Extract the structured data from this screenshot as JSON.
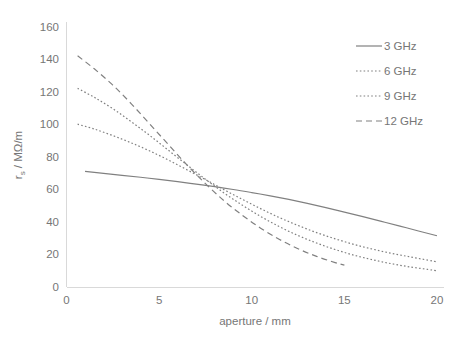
{
  "chart_data": {
    "type": "line",
    "title": "",
    "xlabel": "aperture / mm",
    "ylabel": "r_s / MΩ/m",
    "ylabel_base": "r",
    "ylabel_sub": "s",
    "ylabel_rest": " / MΩ/m",
    "xlim": [
      0,
      20
    ],
    "ylim": [
      0,
      160
    ],
    "xticks": [
      0,
      5,
      10,
      15,
      20
    ],
    "yticks": [
      0,
      20,
      40,
      60,
      80,
      100,
      120,
      140,
      160
    ],
    "xtick_labels": [
      "0",
      "5",
      "10",
      "15",
      "20"
    ],
    "ytick_labels": [
      "0",
      "20",
      "40",
      "60",
      "80",
      "100",
      "120",
      "140",
      "160"
    ],
    "grid": false,
    "legend_position": "top-right",
    "series": [
      {
        "name": "3 GHz",
        "style": "solid",
        "color": "#808080",
        "x": [
          1.0,
          2.0,
          3.0,
          4.0,
          5.0,
          6.0,
          7.0,
          8.0,
          9.0,
          10.0,
          11.0,
          12.0,
          13.0,
          14.0,
          15.0,
          16.0,
          17.0,
          18.0,
          19.0,
          20.0
        ],
        "y": [
          71.0,
          69.8,
          68.6,
          67.4,
          66.1,
          64.7,
          63.2,
          61.6,
          59.9,
          58.0,
          56.0,
          53.8,
          51.4,
          48.8,
          46.0,
          43.2,
          40.3,
          37.4,
          34.4,
          31.5
        ]
      },
      {
        "name": "6 GHz",
        "style": "dotted",
        "color": "#808080",
        "x": [
          0.6,
          1.5,
          2.5,
          3.5,
          4.5,
          5.5,
          6.5,
          7.5,
          8.5,
          9.5,
          10.5,
          11.5,
          12.5,
          13.5,
          14.5,
          15.5,
          16.5,
          17.5,
          18.5,
          19.5,
          20.0
        ],
        "y": [
          100.0,
          97.0,
          93.0,
          88.5,
          83.5,
          78.0,
          72.0,
          66.0,
          59.8,
          53.8,
          48.0,
          42.6,
          37.8,
          33.4,
          29.6,
          26.2,
          23.3,
          20.8,
          18.6,
          16.5,
          15.5
        ]
      },
      {
        "name": "9 GHz",
        "style": "dashdot",
        "color": "#808080",
        "x": [
          0.6,
          1.5,
          2.5,
          3.5,
          4.5,
          5.5,
          6.5,
          7.5,
          8.5,
          9.5,
          10.5,
          11.5,
          12.5,
          13.5,
          14.5,
          15.5,
          16.5,
          17.5,
          18.5,
          19.5,
          20.0
        ],
        "y": [
          122.0,
          116.5,
          109.5,
          101.5,
          93.0,
          84.0,
          75.0,
          66.2,
          57.8,
          50.2,
          43.2,
          37.0,
          31.6,
          27.0,
          23.0,
          19.6,
          16.8,
          14.4,
          12.4,
          10.8,
          10.0
        ]
      },
      {
        "name": "12 GHz",
        "style": "dashed",
        "color": "#808080",
        "x": [
          0.6,
          1.5,
          2.5,
          3.5,
          4.5,
          5.5,
          6.5,
          7.5,
          8.5,
          9.5,
          10.5,
          11.5,
          12.5,
          13.5,
          14.5,
          15.0
        ],
        "y": [
          142.0,
          134.0,
          124.0,
          112.5,
          100.0,
          87.5,
          75.0,
          63.5,
          53.0,
          44.0,
          36.0,
          29.2,
          23.5,
          18.8,
          15.0,
          13.4
        ]
      }
    ],
    "legend": [
      {
        "label": "3 GHz",
        "style": "solid"
      },
      {
        "label": "6 GHz",
        "style": "dotted"
      },
      {
        "label": "9 GHz",
        "style": "dashdot"
      },
      {
        "label": "12 GHz",
        "style": "dashed"
      }
    ],
    "colors": {
      "line": "#808080",
      "axis": "#d9d9d9",
      "text": "#767676",
      "background": "#ffffff"
    }
  }
}
